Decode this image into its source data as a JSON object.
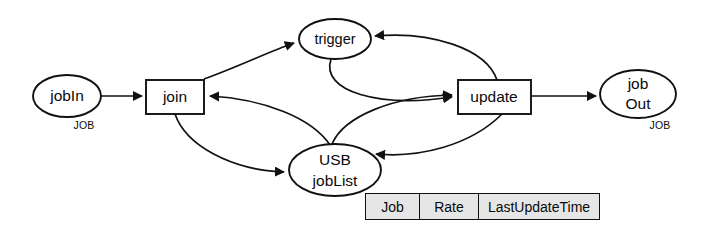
{
  "diagram": {
    "background_color": "#ffffff",
    "line_color": "#111111",
    "nodes": [
      {
        "id": "jobIn",
        "shape": "ellipse",
        "label": "jobIn",
        "type_label": "JOB",
        "cx": 67,
        "cy": 96,
        "rx": 34,
        "ry": 21
      },
      {
        "id": "join",
        "shape": "rectangle",
        "label": "join",
        "x": 146,
        "y": 80,
        "w": 58,
        "h": 34
      },
      {
        "id": "trigger",
        "shape": "ellipse",
        "label": "trigger",
        "cx": 335,
        "cy": 39,
        "rx": 36,
        "ry": 20
      },
      {
        "id": "usbJobList",
        "shape": "ellipse",
        "label_line1": "USB",
        "label_line2": "jobList",
        "cx": 335,
        "cy": 170,
        "rx": 46,
        "ry": 26
      },
      {
        "id": "update",
        "shape": "rectangle",
        "label": "update",
        "x": 458,
        "y": 80,
        "w": 73,
        "h": 34
      },
      {
        "id": "jobOut",
        "shape": "ellipse",
        "label_line1": "job",
        "label_line2": "Out",
        "type_label": "JOB",
        "cx": 638,
        "cy": 94,
        "rx": 38,
        "ry": 24
      }
    ],
    "edges": [
      {
        "from": "jobIn",
        "to": "join",
        "label": ""
      },
      {
        "from": "join",
        "to": "trigger",
        "label": ""
      },
      {
        "from": "join",
        "to": "usbJobList",
        "label": ""
      },
      {
        "from": "trigger",
        "to": "update",
        "label": ""
      },
      {
        "from": "update",
        "to": "trigger",
        "label": ""
      },
      {
        "from": "update",
        "to": "usbJobList",
        "label": ""
      },
      {
        "from": "usbJobList",
        "to": "update",
        "label": ""
      },
      {
        "from": "usbJobList",
        "to": "join",
        "label": ""
      },
      {
        "from": "update",
        "to": "jobOut",
        "label": ""
      }
    ]
  },
  "table": {
    "name": "jobList-table",
    "background_color": "#e6e6e6",
    "border_color": "#111111",
    "headers": [
      "Job",
      "Rate",
      "LastUpdateTime"
    ]
  }
}
